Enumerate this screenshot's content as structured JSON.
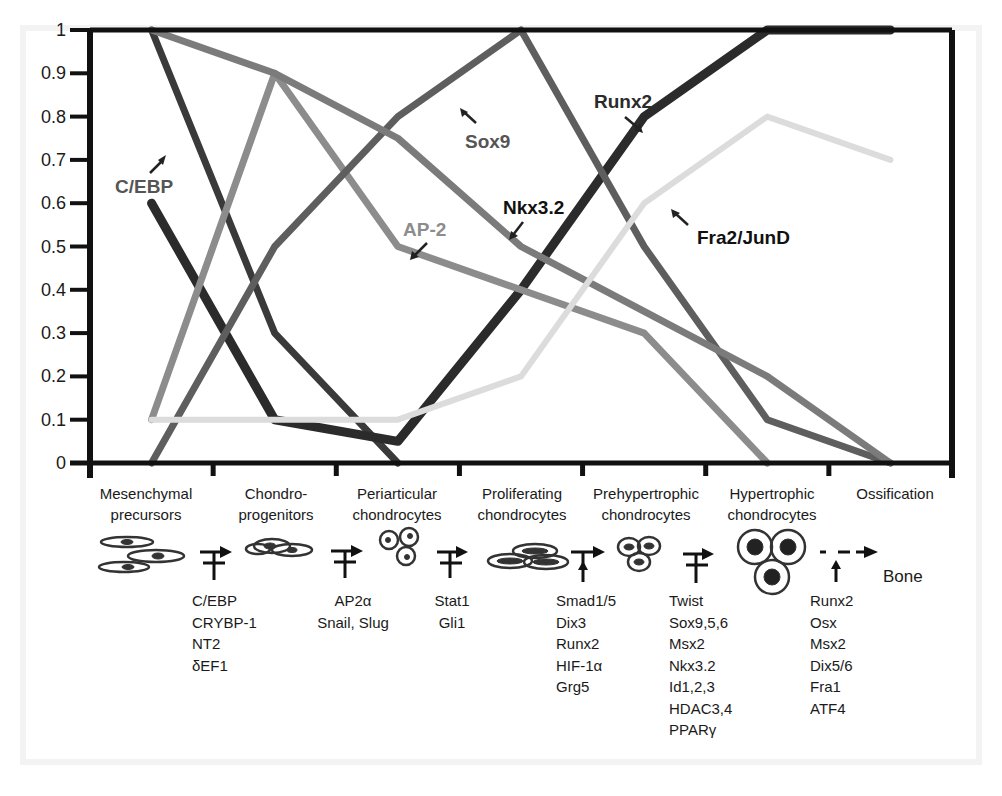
{
  "chart_data": {
    "type": "line",
    "title": "",
    "xlabel": "",
    "ylabel": "",
    "ylim": [
      0,
      1
    ],
    "yticks": [
      "0",
      "0.1",
      "0.2",
      "0.3",
      "0.4",
      "0.5",
      "0.6",
      "0.7",
      "0.8",
      "0.9",
      "1"
    ],
    "grid": false,
    "legend": "inline labels with arrows",
    "categories": [
      "Mesenchymal precursors",
      "Chondro-progenitors",
      "Periarticular chondrocytes",
      "Proliferating chondrocytes",
      "Prehypertrophic chondrocytes",
      "Hypertrophic chondrocytes",
      "Ossification"
    ],
    "series": [
      {
        "name": "C/EBP",
        "color": "#3a3a3a",
        "width": 7,
        "values": [
          1.0,
          0.3,
          0.0,
          null,
          null,
          null,
          null
        ]
      },
      {
        "name": "Runx2",
        "color": "#2b2b2b",
        "width": 9,
        "values": [
          0.6,
          0.1,
          0.05,
          0.4,
          0.8,
          1.0,
          1.0
        ]
      },
      {
        "name": "AP-2",
        "color": "#8c8c8c",
        "width": 7,
        "values": [
          0.1,
          0.9,
          0.5,
          0.4,
          0.3,
          0.0,
          null
        ]
      },
      {
        "name": "Sox9",
        "color": "#5e5e5e",
        "width": 7,
        "values": [
          0.0,
          0.5,
          0.8,
          1.0,
          0.5,
          0.1,
          0.0
        ]
      },
      {
        "name": "Nkx3.2",
        "color": "#7b7b7b",
        "width": 7,
        "values": [
          1.0,
          0.9,
          0.75,
          0.5,
          0.35,
          0.2,
          0.0
        ]
      },
      {
        "name": "Fra2/JunD",
        "color": "#dcdcdc",
        "width": 6,
        "values": [
          0.1,
          0.1,
          0.1,
          0.2,
          0.6,
          0.8,
          0.7
        ]
      }
    ]
  },
  "labels": {
    "cebp": "C/EBP",
    "sox9": "Sox9",
    "runx2": "Runx2",
    "ap2": "AP-2",
    "nkx32": "Nkx3.2",
    "fra2": "Fra2/JunD"
  },
  "stages": [
    {
      "line1": "Mesenchymal",
      "line2": "precursors"
    },
    {
      "line1": "Chondro-",
      "line2": "progenitors"
    },
    {
      "line1": "Periarticular",
      "line2": "chondrocytes"
    },
    {
      "line1": "Proliferating",
      "line2": "chondrocytes"
    },
    {
      "line1": "Prehypertrophic",
      "line2": "chondrocytes"
    },
    {
      "line1": "Hypertrophic",
      "line2": "chondrocytes"
    },
    {
      "line1": "Ossification",
      "line2": ""
    }
  ],
  "end_product": "Bone",
  "regulators": [
    {
      "items": [
        "C/EBP",
        "CRYBP-1",
        "NT2",
        "δEF1"
      ]
    },
    {
      "items": [
        "AP2α",
        "Snail, Slug"
      ]
    },
    {
      "items": [
        "Stat1",
        "Gli1"
      ]
    },
    {
      "items": [
        "Smad1/5",
        "Dix3",
        "Runx2",
        "HIF-1α",
        "Grg5"
      ]
    },
    {
      "items": [
        "Twist",
        "Sox9,5,6",
        "Msx2",
        "Nkx3.2",
        "Id1,2,3",
        "HDAC3,4",
        "PPARγ"
      ]
    },
    {
      "items": [
        "Runx2",
        "Osx",
        "Msx2",
        "Dix5/6",
        "Fra1",
        "ATF4"
      ]
    }
  ]
}
